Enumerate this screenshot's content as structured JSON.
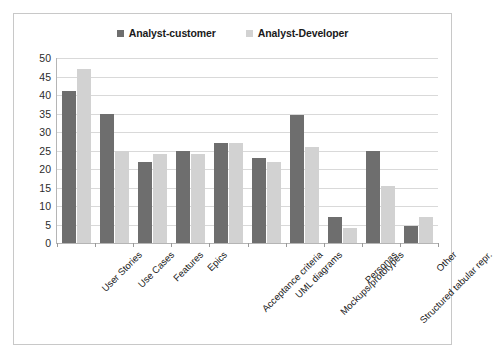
{
  "chart_data": {
    "type": "bar",
    "title": "",
    "subtitle": "",
    "xlabel": "",
    "ylabel": "",
    "ylim": [
      0,
      50
    ],
    "ytick_step": 5,
    "yticks": [
      "0",
      "5",
      "10",
      "15",
      "20",
      "25",
      "30",
      "35",
      "40",
      "45",
      "50"
    ],
    "grid": true,
    "legend_position": "top-center",
    "categories": [
      "User Stories",
      "Use Cases",
      "Features",
      "Epics",
      "Acceptance criteria",
      "UML diagrams",
      "Mockups/prototypes",
      "Personas",
      "Structured tabular repr.",
      "Other"
    ],
    "series": [
      {
        "name": "Analyst-customer",
        "color": "#6e6e6e",
        "values": [
          41,
          35,
          22,
          25,
          27,
          23,
          34.5,
          7,
          25,
          4.5
        ]
      },
      {
        "name": "Analyst-Developer",
        "color": "#d2d2d2",
        "values": [
          47,
          25,
          24,
          24,
          27,
          22,
          26,
          4,
          15.5,
          7
        ]
      }
    ]
  },
  "colors": {
    "series_a": "#6e6e6e",
    "series_b": "#d2d2d2",
    "gridline": "#d9d9d9",
    "axis": "#b5b5b5",
    "frame_border": "#c8c8c8",
    "text": "#1a1a1a",
    "background": "#ffffff"
  }
}
